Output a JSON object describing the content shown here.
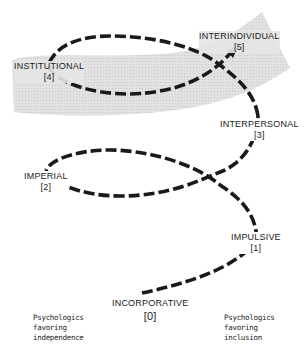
{
  "diagram": {
    "type": "helix / spiral of developmental stages",
    "band_color": "#d9d9d9",
    "line_color": "#1a1a1a",
    "stages": [
      {
        "name": "INCORPORATIVE",
        "number": "[0]"
      },
      {
        "name": "IMPULSIVE",
        "number": "[1]"
      },
      {
        "name": "IMPERIAL",
        "number": "[2]"
      },
      {
        "name": "INTERPERSONAL",
        "number": "[3]"
      },
      {
        "name": "INSTITUTIONAL",
        "number": "[4]"
      },
      {
        "name": "INTERINDIVIDUAL",
        "number": "[5]"
      }
    ],
    "left_caption": {
      "line1": "Psychologics",
      "line2": "favoring",
      "line3": "independence"
    },
    "right_caption": {
      "line1": "Psychologics",
      "line2": "favoring",
      "line3": "inclusion"
    }
  }
}
